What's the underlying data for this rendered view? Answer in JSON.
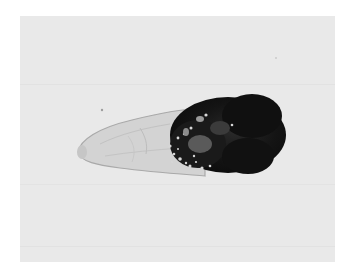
{
  "image": {
    "subject": "micrograph of elongated specimen with dark granular posterior mass",
    "style": "grayscale brightfield microscopy",
    "colors": {
      "background": "#e9e9e9",
      "body_light": "#cfcfcf",
      "body_outline": "#a8a8a8",
      "dark_mass": "#141414",
      "page": "#ffffff"
    }
  }
}
